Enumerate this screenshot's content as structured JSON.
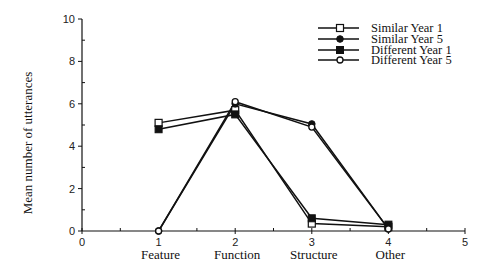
{
  "chart_data": {
    "type": "line",
    "title": "",
    "xlabel": "",
    "ylabel": "Mean number of utterances",
    "x": [
      1,
      2,
      3,
      4
    ],
    "categories": [
      "Feature",
      "Function",
      "Structure",
      "Other"
    ],
    "xlim": [
      0,
      5
    ],
    "ylim": [
      0,
      10
    ],
    "x_ticks": [
      0,
      1,
      2,
      3,
      4,
      5
    ],
    "y_ticks": [
      0,
      2,
      4,
      6,
      8,
      10
    ],
    "grid": false,
    "legend_position": "upper right",
    "series": [
      {
        "name": "Similar Year 1",
        "marker": "open-square",
        "values": [
          5.1,
          5.7,
          0.35,
          0.2
        ]
      },
      {
        "name": "Similar Year 5",
        "marker": "filled-diamond",
        "values": [
          0.0,
          6.0,
          5.05,
          0.1
        ]
      },
      {
        "name": "Different Year 1",
        "marker": "filled-square",
        "values": [
          4.8,
          5.5,
          0.6,
          0.3
        ]
      },
      {
        "name": "Different Year 5",
        "marker": "open-diamond",
        "values": [
          0.0,
          6.1,
          4.9,
          0.1
        ]
      }
    ]
  },
  "legend": {
    "items": [
      {
        "label": "Similar Year 1"
      },
      {
        "label": "Similar Year 5"
      },
      {
        "label": "Different Year 1"
      },
      {
        "label": "Different Year 5"
      }
    ]
  },
  "axes": {
    "y_title": "Mean number of utterances",
    "y_tick_labels": [
      "0",
      "2",
      "4",
      "6",
      "8",
      "10"
    ],
    "x_tick_labels": [
      "0",
      "1",
      "2",
      "3",
      "4",
      "5"
    ],
    "category_labels": [
      "Feature",
      "Function",
      "Structure",
      "Other"
    ]
  },
  "colors": {
    "line": "#111111",
    "background": "#ffffff"
  }
}
